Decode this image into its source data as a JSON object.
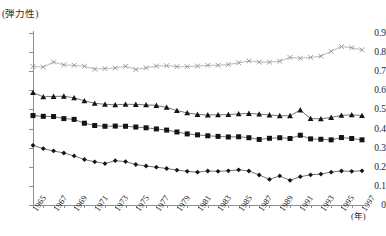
{
  "chart": {
    "title": "",
    "y_unit_label": "(弾力性)",
    "x_unit_label": "(年)"
  },
  "chart_data": {
    "type": "line",
    "title": "",
    "xlabel": "(年)",
    "ylabel": "(弾力性)",
    "ylim": [
      0,
      0.9
    ],
    "ytick_labels": [
      "0.9",
      "0.8",
      "0.7",
      "0.6",
      "0.5",
      "0.4",
      "0.3",
      "0.2",
      "0.1",
      "0"
    ],
    "ytick_values": [
      0.9,
      0.8,
      0.7,
      0.6,
      0.5,
      0.4,
      0.3,
      0.2,
      0.1,
      0
    ],
    "grid": false,
    "legend": "none",
    "x": [
      1965,
      1966,
      1967,
      1968,
      1969,
      1970,
      1971,
      1972,
      1973,
      1974,
      1975,
      1976,
      1977,
      1978,
      1979,
      1980,
      1981,
      1982,
      1983,
      1984,
      1985,
      1986,
      1987,
      1988,
      1989,
      1990,
      1991,
      1992,
      1993,
      1994,
      1995,
      1996,
      1997
    ],
    "xtick_labels": [
      "1965",
      "1967",
      "1969",
      "1971",
      "1973",
      "1975",
      "1977",
      "1979",
      "1981",
      "1983",
      "1985",
      "1987",
      "1989",
      "1991",
      "1993",
      "1995",
      "1997"
    ],
    "xtick_values": [
      1965,
      1967,
      1969,
      1971,
      1973,
      1975,
      1977,
      1979,
      1981,
      1983,
      1985,
      1987,
      1989,
      1991,
      1993,
      1995,
      1997
    ],
    "series": [
      {
        "name": "series-x",
        "marker": "x",
        "values": [
          0.725,
          0.722,
          0.748,
          0.733,
          0.731,
          0.726,
          0.711,
          0.714,
          0.717,
          0.726,
          0.709,
          0.718,
          0.727,
          0.729,
          0.724,
          0.724,
          0.727,
          0.731,
          0.731,
          0.735,
          0.744,
          0.754,
          0.748,
          0.747,
          0.752,
          0.772,
          0.768,
          0.772,
          0.779,
          0.804,
          0.829,
          0.823,
          0.812
        ]
      },
      {
        "name": "series-triangle",
        "marker": "triangle",
        "values": [
          0.588,
          0.566,
          0.568,
          0.569,
          0.561,
          0.545,
          0.532,
          0.527,
          0.524,
          0.527,
          0.526,
          0.524,
          0.521,
          0.511,
          0.494,
          0.482,
          0.474,
          0.471,
          0.472,
          0.473,
          0.477,
          0.479,
          0.476,
          0.471,
          0.467,
          0.467,
          0.497,
          0.452,
          0.451,
          0.458,
          0.469,
          0.472,
          0.468
        ]
      },
      {
        "name": "series-square",
        "marker": "square",
        "values": [
          0.468,
          0.464,
          0.463,
          0.452,
          0.448,
          0.428,
          0.416,
          0.412,
          0.413,
          0.412,
          0.408,
          0.404,
          0.398,
          0.392,
          0.382,
          0.372,
          0.367,
          0.362,
          0.359,
          0.356,
          0.357,
          0.352,
          0.343,
          0.349,
          0.352,
          0.348,
          0.365,
          0.346,
          0.344,
          0.341,
          0.353,
          0.348,
          0.341
        ]
      },
      {
        "name": "series-diamond",
        "marker": "diamond",
        "values": [
          0.312,
          0.295,
          0.283,
          0.272,
          0.257,
          0.238,
          0.226,
          0.217,
          0.232,
          0.227,
          0.212,
          0.204,
          0.198,
          0.191,
          0.183,
          0.176,
          0.172,
          0.178,
          0.176,
          0.179,
          0.184,
          0.178,
          0.157,
          0.134,
          0.152,
          0.129,
          0.148,
          0.158,
          0.162,
          0.172,
          0.178,
          0.176,
          0.179
        ]
      }
    ]
  }
}
